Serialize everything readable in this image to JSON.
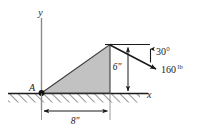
{
  "figure": {
    "axes": {
      "x_label": "x",
      "y_label": "y"
    },
    "points": {
      "support_label": "A"
    },
    "dimensions": [
      {
        "id": "base",
        "label": "8″",
        "value": 8,
        "unit": "in",
        "orientation": "horizontal"
      },
      {
        "id": "height",
        "label": "6″",
        "value": 6,
        "unit": "in",
        "orientation": "vertical"
      }
    ],
    "force": {
      "magnitude_label": "160",
      "unit_label": "lb",
      "angle_label": "30°",
      "angle_value": 30,
      "direction": "down-right below horizontal"
    },
    "colors": {
      "shape_fill": "#c2c2c2",
      "stroke": "#1a1a1a",
      "axis": "#808080",
      "background": "#ffffff"
    }
  }
}
